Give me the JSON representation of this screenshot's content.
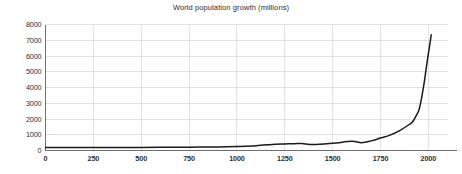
{
  "chart_data": {
    "type": "line",
    "title": "World population growth (millions)",
    "xlabel": "",
    "ylabel": "",
    "xlim": [
      0,
      2100
    ],
    "ylim": [
      0,
      8000
    ],
    "grid": true,
    "legend": null,
    "x_ticks": [
      0,
      250,
      500,
      750,
      1000,
      1250,
      1500,
      1750,
      2000
    ],
    "y_ticks": [
      0,
      1000,
      2000,
      3000,
      4000,
      5000,
      6000,
      7000,
      8000
    ],
    "series": [
      {
        "name": "World population",
        "x": [
          0,
          100,
          200,
          300,
          400,
          500,
          600,
          700,
          800,
          900,
          1000,
          1100,
          1200,
          1250,
          1300,
          1340,
          1400,
          1500,
          1600,
          1650,
          1700,
          1750,
          1800,
          1850,
          1900,
          1920,
          1940,
          1950,
          1960,
          1970,
          1980,
          1990,
          2000,
          2010,
          2015
        ],
        "values": [
          190,
          190,
          190,
          190,
          190,
          190,
          200,
          207,
          220,
          226,
          254,
          301,
          400,
          416,
          432,
          443,
          374,
          458,
          580,
          500,
          610,
          791,
          978,
          1262,
          1650,
          1860,
          2300,
          2536,
          3035,
          3700,
          4458,
          5327,
          6144,
          6930,
          7349
        ]
      }
    ]
  },
  "axes": {
    "y_tick_labels": [
      "0",
      "1000",
      "2000",
      "3000",
      "4000",
      "5000",
      "6000",
      "7000",
      "8000"
    ],
    "x_tick_labels": [
      "0",
      "250",
      "500",
      "750",
      "1000",
      "1250",
      "1500",
      "1750",
      "2000"
    ]
  },
  "colors": {
    "background": "#ffffff",
    "grid": "#d4d4d4",
    "axis": "#6e6e6e",
    "line": "#1a1a1a",
    "text": "#2b2b2b"
  }
}
